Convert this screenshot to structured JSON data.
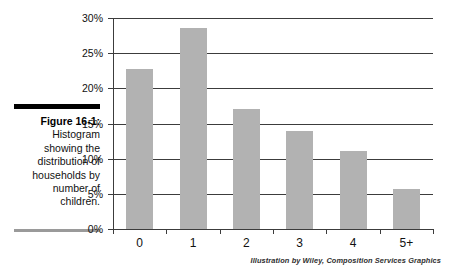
{
  "figure": {
    "label": "Figure 16-1:",
    "caption": "Histogram showing the distribution of house­holds by number of children.",
    "credit": "Illustration by Wiley, Composition Services Graphics"
  },
  "colors": {
    "bar_fill": "#b2b2b2",
    "axis": "#3c3c3c",
    "text": "#111111",
    "rule_top": "#000000",
    "rule_bottom": "#9a9a9a",
    "background": "#ffffff"
  },
  "chart_data": {
    "type": "bar",
    "title": "",
    "subtitle": "",
    "xlabel": "",
    "ylabel": "",
    "categories": [
      "0",
      "1",
      "2",
      "3",
      "4",
      "5+"
    ],
    "values": [
      22.8,
      28.6,
      17.0,
      14.0,
      11.1,
      5.7
    ],
    "value_unit": "%",
    "ylim": [
      0,
      30
    ],
    "ytick_values": [
      0,
      5,
      10,
      15,
      20,
      25,
      30
    ],
    "ytick_labels": [
      "0%",
      "5%",
      "10%",
      "15%",
      "20%",
      "25%",
      "30%"
    ],
    "grid": "horizontal",
    "legend": "none",
    "annotations": []
  }
}
